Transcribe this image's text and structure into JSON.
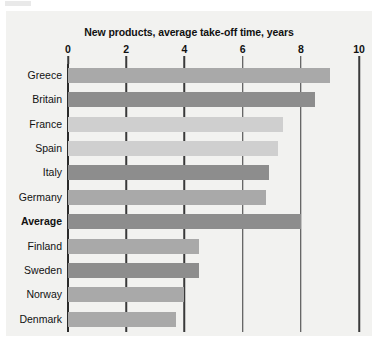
{
  "chart_data": {
    "type": "bar",
    "orientation": "horizontal",
    "title": "New products, average take-off time, years",
    "xlabel": "",
    "ylabel": "",
    "xlim": [
      0,
      10
    ],
    "xticks": [
      0,
      2,
      4,
      6,
      8,
      10
    ],
    "xtick_labels": [
      "0",
      "2",
      "4",
      "6",
      "8",
      "10"
    ],
    "grid": true,
    "legend": "none",
    "units": "years",
    "categories": [
      "Greece",
      "Britain",
      "France",
      "Spain",
      "Italy",
      "Germany",
      "Average",
      "Finland",
      "Sweden",
      "Norway",
      "Denmark"
    ],
    "values": [
      9.0,
      8.5,
      7.4,
      7.2,
      6.9,
      6.8,
      8.0,
      4.5,
      4.5,
      4.0,
      3.7
    ],
    "bar_shades": [
      "medium",
      "dark",
      "light",
      "light",
      "dark",
      "medium",
      "dark",
      "medium",
      "dark",
      "medium",
      "medium"
    ],
    "emphasized_categories": [
      "Average"
    ],
    "points": [
      {
        "category": "Greece",
        "value": 9.0,
        "shade": "medium"
      },
      {
        "category": "Britain",
        "value": 8.5,
        "shade": "dark"
      },
      {
        "category": "France",
        "value": 7.4,
        "shade": "light"
      },
      {
        "category": "Spain",
        "value": 7.2,
        "shade": "light"
      },
      {
        "category": "Italy",
        "value": 6.9,
        "shade": "dark"
      },
      {
        "category": "Germany",
        "value": 6.8,
        "shade": "medium"
      },
      {
        "category": "Average",
        "value": 8.0,
        "shade": "dark"
      },
      {
        "category": "Finland",
        "value": 4.5,
        "shade": "medium"
      },
      {
        "category": "Sweden",
        "value": 4.5,
        "shade": "dark"
      },
      {
        "category": "Norway",
        "value": 4.0,
        "shade": "medium"
      },
      {
        "category": "Denmark",
        "value": 3.7,
        "shade": "medium"
      }
    ]
  },
  "colors": {
    "background": "#ffffff",
    "plot_background": "#f2f2f0",
    "axis": "#3a3a3a",
    "text": "#111111",
    "bar_dark": "#8d8d8d",
    "bar_medium": "#a9a9a9",
    "bar_light": "#cfcfcf"
  }
}
